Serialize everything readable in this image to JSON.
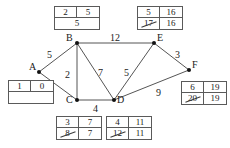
{
  "diagram": {
    "nodes": [
      {
        "id": "A",
        "label": "A",
        "x": 39,
        "y": 72,
        "label_dx": -10,
        "label_dy": -5
      },
      {
        "id": "B",
        "label": "B",
        "x": 77,
        "y": 43,
        "label_dx": -11,
        "label_dy": -5
      },
      {
        "id": "C",
        "label": "C",
        "x": 77,
        "y": 100,
        "label_dx": -11,
        "label_dy": 0
      },
      {
        "id": "D",
        "label": "D",
        "x": 114,
        "y": 100,
        "label_dx": 3,
        "label_dy": 0
      },
      {
        "id": "E",
        "label": "E",
        "x": 154,
        "y": 43,
        "label_dx": 3,
        "label_dy": -5
      },
      {
        "id": "F",
        "label": "F",
        "x": 189,
        "y": 70,
        "label_dx": 3,
        "label_dy": -5
      }
    ],
    "edges": [
      {
        "from": "A",
        "to": "B",
        "weight": "5",
        "lx": 47,
        "ly": 50
      },
      {
        "from": "A",
        "to": "C",
        "weight": "8",
        "lx": 44,
        "ly": 84
      },
      {
        "from": "B",
        "to": "C",
        "weight": "2",
        "lx": 65,
        "ly": 70
      },
      {
        "from": "B",
        "to": "D",
        "weight": "7",
        "lx": 98,
        "ly": 68
      },
      {
        "from": "B",
        "to": "E",
        "weight": "12",
        "lx": 110,
        "ly": 33
      },
      {
        "from": "C",
        "to": "D",
        "weight": "4",
        "lx": 93,
        "ly": 104
      },
      {
        "from": "D",
        "to": "E",
        "weight": "5",
        "lx": 124,
        "ly": 68
      },
      {
        "from": "D",
        "to": "F",
        "weight": "9",
        "lx": 156,
        "ly": 88
      },
      {
        "from": "E",
        "to": "F",
        "weight": "3",
        "lx": 175,
        "ly": 50
      }
    ],
    "tables": [
      {
        "node": "A",
        "x": 8,
        "y": 80,
        "w": 46,
        "top_left": "1",
        "top_right": "0",
        "bottom_left": "",
        "bottom_right": "",
        "bottom_struck": false,
        "bottom_empty": true
      },
      {
        "node": "B",
        "x": 54,
        "y": 6,
        "w": 46,
        "top_left": "2",
        "top_right": "5",
        "bottom_left": "5",
        "bottom_right": "",
        "bottom_struck": false,
        "bottom_span": true
      },
      {
        "node": "E",
        "x": 137,
        "y": 6,
        "w": 46,
        "top_left": "5",
        "top_right": "16",
        "bottom_left": "17",
        "bottom_right": "16",
        "bottom_struck": true
      },
      {
        "node": "C",
        "x": 56,
        "y": 116,
        "w": 46,
        "top_left": "3",
        "top_right": "7",
        "bottom_left": "8",
        "bottom_right": "7",
        "bottom_struck": true
      },
      {
        "node": "D",
        "x": 106,
        "y": 116,
        "w": 46,
        "top_left": "4",
        "top_right": "11",
        "bottom_left": "12",
        "bottom_right": "11",
        "bottom_struck": true
      },
      {
        "node": "F",
        "x": 181,
        "y": 81,
        "w": 46,
        "top_left": "6",
        "top_right": "19",
        "bottom_left": "20",
        "bottom_right": "19",
        "bottom_struck": true
      }
    ],
    "colors": {
      "line": "#555555",
      "text": "#1a1a1a",
      "box_border": "#5a5a5a",
      "background": "#ffffff"
    }
  }
}
